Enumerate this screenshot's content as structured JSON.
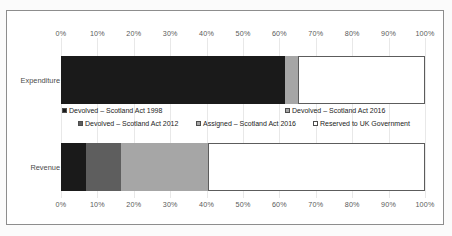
{
  "chart_data": {
    "type": "bar",
    "orientation": "horizontal",
    "stacked": true,
    "stack_mode": "percent",
    "title": "",
    "xlabel": "",
    "ylabel": "",
    "xlim": [
      0,
      100
    ],
    "grid": true,
    "legend_position": "middle",
    "categories": [
      "Expenditure",
      "Revenue"
    ],
    "tick_labels": [
      "0%",
      "10%",
      "20%",
      "30%",
      "40%",
      "50%",
      "60%",
      "70%",
      "80%",
      "90%",
      "100%"
    ],
    "tick_values": [
      0,
      10,
      20,
      30,
      40,
      50,
      60,
      70,
      80,
      90,
      100
    ],
    "axis_top": true,
    "axis_bottom": true,
    "series": [
      {
        "name": "Devolved – Scotland Act 1998",
        "color": "#1a1a1a",
        "values": [
          61.5,
          7.0
        ]
      },
      {
        "name": "Devolved – Scotland Act 2012",
        "color": "#5e5e5e",
        "values": [
          0.0,
          9.5
        ]
      },
      {
        "name": "Devolved – Scotland Act 2016",
        "color": "#a6a6a6",
        "values": [
          3.5,
          24.0
        ]
      },
      {
        "name": "Assigned – Scotland Act 2016",
        "color": "#a6a6a6",
        "values": [
          0.0,
          0.0
        ]
      },
      {
        "name": "Reserved to UK Government",
        "color": "#ffffff",
        "values": [
          35.0,
          59.5
        ]
      }
    ]
  },
  "legend": {
    "row1": [
      {
        "label": "Devolved – Scotland Act 1998",
        "color": "#1a1a1a",
        "left": 62
      },
      {
        "label": "Devolved – Scotland Act 2016",
        "color": "#a6a6a6",
        "left": 285
      }
    ],
    "row2": [
      {
        "label": "Devolved – Scotland Act 2012",
        "color": "#5e5e5e",
        "left": 78
      },
      {
        "label": "Assigned – Scotland Act 2016",
        "color": "#a6a6a6",
        "left": 196
      },
      {
        "label": "Reserved to UK Government",
        "color": "#ffffff",
        "left": 313
      }
    ]
  },
  "colors": {
    "devolved_1998": "#1a1a1a",
    "devolved_2012": "#5e5e5e",
    "devolved_2016": "#a6a6a6",
    "assigned_2016": "#a6a6a6",
    "reserved_uk": "#ffffff",
    "border": "#8d8d8d",
    "gridline": "#e8e8e8",
    "tick_text": "#5a5a5a"
  }
}
